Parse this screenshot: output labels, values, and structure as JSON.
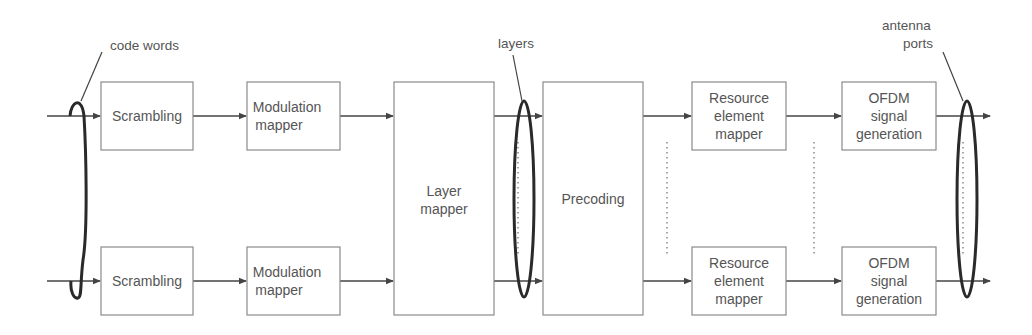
{
  "diagram": {
    "title": "",
    "annotations": {
      "code_words": "code words",
      "layers": "layers",
      "antenna_line1": "antenna",
      "antenna_line2": "ports"
    },
    "blocks": {
      "scrambling_top": [
        "Scrambling"
      ],
      "scrambling_bottom": [
        "Scrambling"
      ],
      "modulation_top": [
        "Modulation",
        "mapper"
      ],
      "modulation_bottom": [
        "Modulation",
        "mapper"
      ],
      "layer_mapper": [
        "Layer",
        "mapper"
      ],
      "precoding": [
        "Precoding"
      ],
      "re_mapper_top": [
        "Resource",
        "element",
        "mapper"
      ],
      "re_mapper_bottom": [
        "Resource",
        "element",
        "mapper"
      ],
      "ofdm_top": [
        "OFDM",
        "signal",
        "generation"
      ],
      "ofdm_bottom": [
        "OFDM",
        "signal",
        "generation"
      ]
    },
    "flow": [
      "Scrambling",
      "Modulation mapper",
      "Layer mapper",
      "Precoding",
      "Resource element mapper",
      "OFDM signal generation"
    ],
    "colors": {
      "box_border": "#8a8a8a",
      "text": "#555555",
      "arrow": "#444444",
      "ellipse": "#2a2a2a"
    }
  }
}
